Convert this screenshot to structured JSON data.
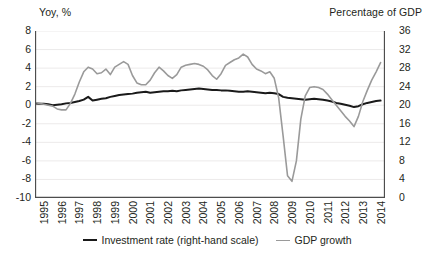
{
  "chart_data": {
    "type": "line",
    "title": "",
    "subtitle": "",
    "left_axis_title": "Yoy, %",
    "right_axis_title": "Percentage of GDP",
    "xlabel": "",
    "grid": true,
    "legend_position": "bottom-center",
    "x": [
      1995.0,
      1995.25,
      1995.5,
      1995.75,
      1996.0,
      1996.25,
      1996.5,
      1996.75,
      1997.0,
      1997.25,
      1997.5,
      1997.75,
      1998.0,
      1998.25,
      1998.5,
      1998.75,
      1999.0,
      1999.25,
      1999.5,
      1999.75,
      2000.0,
      2000.25,
      2000.5,
      2000.75,
      2001.0,
      2001.25,
      2001.5,
      2001.75,
      2002.0,
      2002.25,
      2002.5,
      2002.75,
      2003.0,
      2003.25,
      2003.5,
      2003.75,
      2004.0,
      2004.25,
      2004.5,
      2004.75,
      2005.0,
      2005.25,
      2005.5,
      2005.75,
      2006.0,
      2006.25,
      2006.5,
      2006.75,
      2007.0,
      2007.25,
      2007.5,
      2007.75,
      2008.0,
      2008.25,
      2008.5,
      2008.75,
      2009.0,
      2009.25,
      2009.5,
      2009.75,
      2010.0,
      2010.25,
      2010.5,
      2010.75,
      2011.0,
      2011.25,
      2011.5,
      2011.75,
      2012.0,
      2012.25,
      2012.5,
      2012.75,
      2013.0,
      2013.25,
      2013.5,
      2013.75,
      2014.0,
      2014.25,
      2014.5
    ],
    "xtick_labels": [
      "1995",
      "1996",
      "1997",
      "1998",
      "1999",
      "2000",
      "2001",
      "2002",
      "2003",
      "2004",
      "2005",
      "2006",
      "2007",
      "2008",
      "2009",
      "2010",
      "2011",
      "2012",
      "2013",
      "2014"
    ],
    "xlim": [
      1995.0,
      2014.75
    ],
    "left_axis": {
      "label": "Yoy, %",
      "ylim": [
        -10,
        8
      ],
      "ticks": [
        8,
        6,
        4,
        2,
        0,
        -2,
        -4,
        -6,
        -8,
        -10
      ],
      "tick_labels": [
        "8",
        "6",
        "4",
        "2",
        "0",
        "-2",
        "-4",
        "-6",
        "-8",
        "-10"
      ]
    },
    "right_axis": {
      "label": "Percentage of GDP",
      "ylim": [
        0,
        36
      ],
      "ticks": [
        36,
        32,
        28,
        24,
        20,
        16,
        12,
        8,
        4,
        0
      ],
      "tick_labels": [
        "36",
        "32",
        "28",
        "24",
        "20",
        "16",
        "12",
        "8",
        "4",
        "0"
      ]
    },
    "series": [
      {
        "name": "Investment rate (right-hand scale)",
        "axis": "right",
        "color": "#1a1a1a",
        "width": 2.0,
        "values": [
          20.4,
          20.3,
          20.3,
          20.2,
          20.0,
          20.1,
          20.2,
          20.4,
          20.5,
          20.7,
          20.9,
          21.2,
          21.8,
          21.0,
          21.2,
          21.4,
          21.5,
          21.8,
          22.0,
          22.2,
          22.3,
          22.4,
          22.5,
          22.7,
          22.8,
          22.9,
          22.7,
          22.8,
          22.9,
          23.0,
          23.0,
          23.1,
          23.0,
          23.2,
          23.3,
          23.4,
          23.5,
          23.6,
          23.5,
          23.4,
          23.3,
          23.3,
          23.2,
          23.2,
          23.1,
          23.0,
          22.9,
          22.9,
          23.0,
          22.9,
          22.8,
          22.7,
          22.6,
          22.7,
          22.6,
          22.4,
          21.8,
          21.6,
          21.5,
          21.4,
          21.3,
          21.2,
          21.3,
          21.4,
          21.3,
          21.2,
          21.0,
          20.8,
          20.5,
          20.3,
          20.1,
          19.9,
          19.6,
          19.8,
          20.2,
          20.5,
          20.7,
          20.9,
          21.0
        ]
      },
      {
        "name": "GDP growth",
        "axis": "left",
        "color": "#9a9a9a",
        "width": 1.6,
        "values": [
          0.3,
          0.2,
          0.1,
          0.0,
          -0.1,
          -0.4,
          -0.5,
          -0.5,
          0.2,
          1.2,
          2.5,
          3.6,
          4.1,
          3.9,
          3.4,
          3.5,
          3.9,
          3.3,
          4.1,
          4.4,
          4.7,
          4.4,
          3.2,
          2.4,
          2.2,
          2.2,
          2.7,
          3.5,
          4.1,
          3.7,
          3.2,
          2.9,
          3.3,
          4.1,
          4.3,
          4.4,
          4.5,
          4.4,
          4.2,
          3.8,
          3.2,
          2.8,
          3.4,
          4.3,
          4.6,
          4.9,
          5.1,
          5.5,
          5.2,
          4.4,
          3.9,
          3.7,
          3.4,
          3.6,
          2.9,
          0.8,
          -3.3,
          -7.6,
          -8.2,
          -6.0,
          -1.5,
          1.0,
          1.9,
          2.0,
          1.9,
          1.7,
          1.2,
          0.6,
          0.0,
          -0.6,
          -1.2,
          -1.7,
          -2.3,
          -1.2,
          0.4,
          1.6,
          2.7,
          3.6,
          4.6
        ]
      }
    ]
  },
  "legend": {
    "items": [
      {
        "label": "Investment rate (right-hand scale)",
        "color": "#1a1a1a",
        "width": 2.2
      },
      {
        "label": "GDP growth",
        "color": "#9a9a9a",
        "width": 1.8
      }
    ]
  },
  "style": {
    "background": "#ffffff",
    "gridline_color": "#eceaea",
    "axis_color": "#4d4d4d",
    "text_color": "#231f20"
  }
}
